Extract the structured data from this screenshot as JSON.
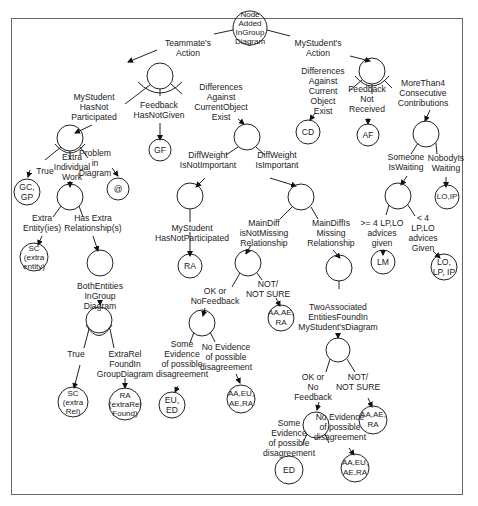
{
  "diagram": {
    "root": {
      "label": "Node\nAdded\nInGroup\nDiagram"
    },
    "edges": {
      "teammate_action": "Teammate's\nAction",
      "mystudent_action": "MyStudent's\nAction",
      "mystudent_hasnot_participated": "MyStudent\nHasNot\nParticipated",
      "feedback_hasnotgiven": "Feedback\nHasNotGiven",
      "differences_current_object_left": "Differences\nAgainst\nCurrentObject\nExist",
      "differences_current_object_right": "Differences\nAgainst\nCurrent\nObject\nExist",
      "feedback_not_received": "Feedback\nNot\nReceived",
      "more_than4": "MoreThan4\nConsecutive\nContributions",
      "true1": "True",
      "extra_individual_work": "Extra\nIndividual\nWork",
      "problem_in_diagram": "Problem\nin\nDiagram",
      "diffweight_not_important": "DiffWeight\nIsNotImportant",
      "diffweight_important": "DiffWeight\nIsImportant",
      "someone_waiting": "Someone\nIsWaiting",
      "nobody_waiting": "NobodyIs\nWaiting",
      "ge4_advices": ">= 4 LP,LO\nadvices\ngiven",
      "lt4_advices": "< 4\nLP,LO\nadvices\nGiven",
      "extra_entities": "Extra\nEntity(ies)",
      "has_extra_relationships": "Has Extra\nRelationship(s)",
      "mystudent_hasnot_participated2": "MyStudent\nHasNotParticipated",
      "maindiff_not_missing": "MainDiff\nisNotMissing\nRelationship",
      "maindiff_missing": "MainDiffIs\nMissing\nRelationship",
      "both_entities": "BothEntities\nInGroup\nDiagram",
      "ok_or_nofeedback": "OK or\nNoFeedback",
      "not_notsure1": "NOT/\nNOT SURE",
      "two_associated": "TwoAssociated\nEntitiesFoundIn\nMyStudent'sDiagram",
      "true2": "True",
      "extrarel_found": "ExtraRel\nFoundIn\nGroupDiagram",
      "some_evidence1": "Some\nEvidence\nof possible\ndisagreement",
      "no_evidence1": "No Evidence\nof possible\ndisagreement",
      "ok_or_no_feedback2": "OK or\nNo\nFeedback",
      "not_notsure2": "NOT/\nNOT SURE",
      "some_evidence2": "Some\nEvidence\nof possible\ndisagreement",
      "no_evidence2": "No Evidence\nof possible\ndisagreement"
    },
    "leaves": {
      "gf": "GF",
      "cd": "CD",
      "af": "AF",
      "gc_gp": "GC,\nGP",
      "at": "@",
      "lo_ip": "LO,IP",
      "ra1": "RA",
      "lm": "LM",
      "lo_lp_ip": "LO,\nLP, IP",
      "sc_entity": "SC\n(extra\nentity)",
      "aa_ae_ra1": "AA,AE,\nRA",
      "sc_rel": "SC\n(extra\nRel)",
      "ra_extrarel": "RA\n(extraRel\nFound)",
      "eu_ed": "EU,\nED",
      "aa_eu_ae_ra1": "AA,EU,\nAE,RA",
      "aa_ae_ra2": "AA,AE,\nRA",
      "ed": "ED",
      "aa_eu_ae_ra2": "AA,EU,\nAE,RA"
    }
  }
}
